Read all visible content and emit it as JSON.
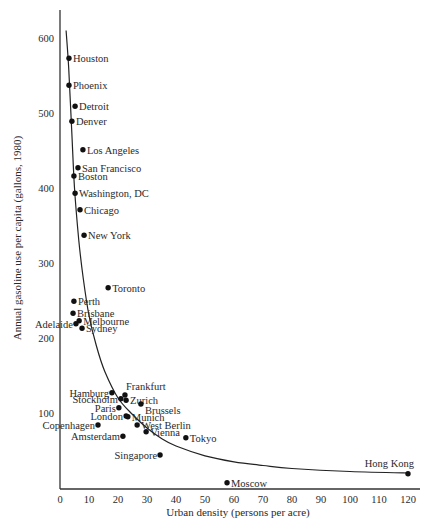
{
  "chart_data": {
    "type": "scatter",
    "title": "",
    "xlabel": "Urban density (persons per acre)",
    "ylabel": "Annual gasoline use per capita (gallons, 1980)",
    "xlim": [
      0,
      125
    ],
    "ylim": [
      0,
      630
    ],
    "xticks": [
      0,
      10,
      20,
      30,
      40,
      50,
      60,
      70,
      80,
      90,
      100,
      110,
      120
    ],
    "yticks": [
      100,
      200,
      300,
      400,
      500,
      600
    ],
    "grid": false,
    "legend": "none",
    "points": [
      {
        "label": "Houston",
        "x": 3.1,
        "y": 573,
        "label_side": "right"
      },
      {
        "label": "Phoenix",
        "x": 3.1,
        "y": 537,
        "label_side": "right"
      },
      {
        "label": "Detroit",
        "x": 5.2,
        "y": 509,
        "label_side": "right"
      },
      {
        "label": "Denver",
        "x": 4.1,
        "y": 489,
        "label_side": "right"
      },
      {
        "label": "Los Angeles",
        "x": 7.9,
        "y": 451,
        "label_side": "right"
      },
      {
        "label": "San Francisco",
        "x": 6.2,
        "y": 427,
        "label_side": "right"
      },
      {
        "label": "Boston",
        "x": 4.8,
        "y": 416,
        "label_side": "right"
      },
      {
        "label": "Washington, DC",
        "x": 5.2,
        "y": 393,
        "label_side": "right"
      },
      {
        "label": "Chicago",
        "x": 6.9,
        "y": 371,
        "label_side": "right"
      },
      {
        "label": "New York",
        "x": 8.3,
        "y": 337,
        "label_side": "right"
      },
      {
        "label": "Toronto",
        "x": 16.6,
        "y": 267,
        "label_side": "right"
      },
      {
        "label": "Perth",
        "x": 4.8,
        "y": 249,
        "label_side": "right"
      },
      {
        "label": "Brisbane",
        "x": 4.5,
        "y": 233,
        "label_side": "right"
      },
      {
        "label": "Adelaide",
        "x": 5.5,
        "y": 219,
        "label_side": "left"
      },
      {
        "label": "Melbourne",
        "x": 6.6,
        "y": 223,
        "label_side": "right"
      },
      {
        "label": "Sydney",
        "x": 7.6,
        "y": 213,
        "label_side": "right"
      },
      {
        "label": "Hamburg",
        "x": 17.9,
        "y": 127,
        "label_side": "left"
      },
      {
        "label": "Frankfurt",
        "x": 22.4,
        "y": 124,
        "label_side": "above-right"
      },
      {
        "label": "Stockholm",
        "x": 21.0,
        "y": 119,
        "label_side": "left"
      },
      {
        "label": "Zurich",
        "x": 22.8,
        "y": 117,
        "label_side": "right"
      },
      {
        "label": "Paris",
        "x": 20.3,
        "y": 107,
        "label_side": "left"
      },
      {
        "label": "Brussels",
        "x": 27.9,
        "y": 112,
        "label_side": "right-below"
      },
      {
        "label": "London",
        "x": 22.8,
        "y": 96,
        "label_side": "left"
      },
      {
        "label": "Munich",
        "x": 23.4,
        "y": 95,
        "label_side": "right"
      },
      {
        "label": "West Berlin",
        "x": 26.6,
        "y": 84,
        "label_side": "right"
      },
      {
        "label": "Copenhagen",
        "x": 13.1,
        "y": 84,
        "label_side": "left"
      },
      {
        "label": "Vienna",
        "x": 29.7,
        "y": 75,
        "label_side": "right"
      },
      {
        "label": "Amsterdam",
        "x": 21.7,
        "y": 69,
        "label_side": "left"
      },
      {
        "label": "Tokyo",
        "x": 43.4,
        "y": 67,
        "label_side": "right"
      },
      {
        "label": "Singapore",
        "x": 34.5,
        "y": 44,
        "label_side": "left"
      },
      {
        "label": "Moscow",
        "x": 57.6,
        "y": 7,
        "label_side": "right"
      },
      {
        "label": "Hong Kong",
        "x": 120,
        "y": 19,
        "label_side": "above-left"
      }
    ],
    "trend_curve": {
      "description": "hyperbolic fit curve",
      "points": [
        [
          2.1,
          610
        ],
        [
          3,
          560
        ],
        [
          4,
          480
        ],
        [
          5,
          400
        ],
        [
          6.5,
          330
        ],
        [
          8,
          280
        ],
        [
          10,
          230
        ],
        [
          12.5,
          190
        ],
        [
          15.5,
          155
        ],
        [
          20,
          120
        ],
        [
          25,
          98
        ],
        [
          30,
          80
        ],
        [
          35,
          66
        ],
        [
          40,
          56
        ],
        [
          50,
          43
        ],
        [
          60,
          35
        ],
        [
          70,
          30
        ],
        [
          80,
          26
        ],
        [
          100,
          22
        ],
        [
          120,
          20
        ]
      ]
    }
  }
}
